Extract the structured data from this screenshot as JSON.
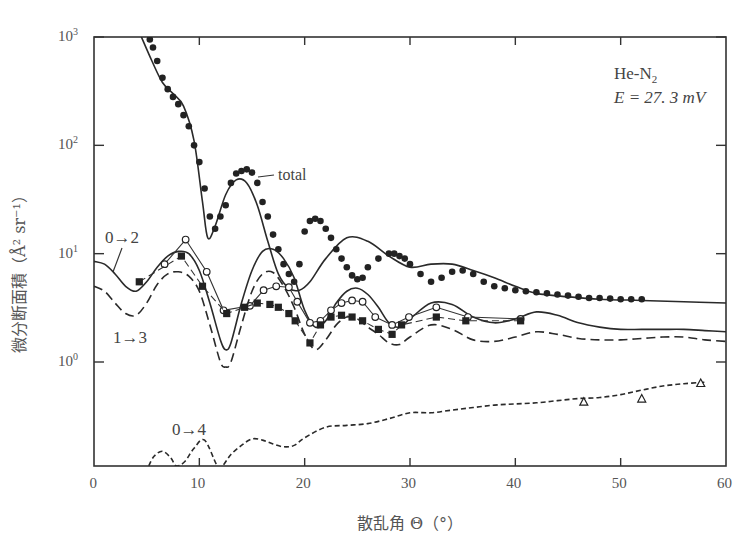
{
  "chart_data": {
    "type": "line",
    "annotation_system": "He-N",
    "annotation_system_sub": "2",
    "annotation_energy": "E = 27. 3 mV",
    "xlabel": "散乱角 Θ（°）",
    "ylabel": "微分断面積（Å² sr⁻¹）",
    "xlim": [
      0,
      60
    ],
    "ylim_log10": [
      -0.96,
      3
    ],
    "yscale": "log",
    "x_ticks": [
      0,
      10,
      20,
      30,
      40,
      50,
      60
    ],
    "y_ticks": [
      {
        "exp": 3,
        "label": "10",
        "sup": "3"
      },
      {
        "exp": 2,
        "label": "10",
        "sup": "2"
      },
      {
        "exp": 1,
        "label": "10",
        "sup": "1"
      },
      {
        "exp": 0,
        "label": "10",
        "sup": "0"
      }
    ],
    "labels": {
      "total": "total",
      "t02": "0→2",
      "t13": "1→3",
      "t04": "0→4"
    },
    "series": [
      {
        "name": "total (calc)",
        "style": "solid",
        "x": [
          4.5,
          5.5,
          6.5,
          7.5,
          8.5,
          9.5,
          10.3,
          10.8,
          11.5,
          12.5,
          13.5,
          14.5,
          15.5,
          16.5,
          17.5,
          18.5,
          19.5,
          20.5,
          22,
          24,
          26,
          28,
          30,
          32,
          34,
          36,
          38,
          40,
          42,
          45,
          48,
          52,
          56,
          60
        ],
        "y": [
          1000,
          600,
          380,
          300,
          230,
          110,
          30,
          14,
          18,
          35,
          48,
          45,
          28,
          13,
          6.5,
          4.8,
          4.6,
          5.5,
          9,
          14,
          13,
          9.5,
          7.5,
          8,
          8,
          7,
          6,
          5,
          4.3,
          4,
          3.8,
          3.7,
          3.6,
          3.5
        ]
      },
      {
        "name": "total (exp)",
        "style": "filled-dot",
        "x": [
          5.3,
          5.6,
          6,
          6.5,
          7,
          7.5,
          8,
          8.5,
          9,
          9.5,
          10,
          10.5,
          11,
          11.5,
          12,
          12.5,
          13,
          13.5,
          14,
          14.5,
          15,
          15.5,
          16,
          16.5,
          17,
          17.5,
          18,
          18.5,
          19,
          19.5,
          20,
          20.5,
          21,
          21.5,
          22,
          22.5,
          23,
          23.5,
          24,
          24.5,
          25,
          25.5,
          26,
          27,
          28,
          28.5,
          29,
          29.5,
          30,
          31,
          32,
          33,
          34,
          35,
          36,
          37,
          38,
          39,
          40,
          41,
          42,
          43,
          44,
          45,
          46,
          47,
          48,
          49,
          50,
          51,
          52
        ],
        "y": [
          950,
          800,
          600,
          420,
          330,
          280,
          240,
          190,
          150,
          100,
          70,
          40,
          22,
          17,
          22,
          28,
          45,
          55,
          58,
          60,
          56,
          45,
          30,
          22,
          15,
          11,
          8,
          6.5,
          5.5,
          8,
          16,
          20,
          21,
          20,
          17,
          14,
          11,
          9,
          7.5,
          6.3,
          5.8,
          6,
          7.5,
          9,
          10,
          10,
          9.5,
          9,
          8,
          6.5,
          5.5,
          6,
          6.8,
          7,
          6.5,
          5.5,
          5,
          4.8,
          4.6,
          4.5,
          4.4,
          4.3,
          4.2,
          4.1,
          4.0,
          3.9,
          3.9,
          3.85,
          3.8,
          3.8,
          3.8
        ]
      },
      {
        "name": "0→2 (calc)",
        "style": "solid",
        "x": [
          0,
          1,
          2,
          3,
          4,
          5,
          6,
          7,
          8,
          9,
          10,
          11,
          12,
          12.5,
          13,
          14,
          15,
          16,
          17,
          18,
          19,
          20,
          21,
          22,
          23,
          24,
          25,
          26,
          27,
          28,
          29,
          30,
          32,
          34,
          36,
          38,
          40,
          42,
          44,
          46,
          48,
          50,
          52,
          54,
          56,
          58,
          60
        ],
        "y": [
          8.5,
          8,
          6.5,
          5,
          4.5,
          5.5,
          7.5,
          9.5,
          10.5,
          10,
          7,
          3.5,
          1.6,
          1.3,
          1.5,
          3.5,
          7,
          10.5,
          11,
          9,
          6,
          3,
          2.1,
          2.4,
          3.5,
          4.5,
          4.8,
          4.2,
          3.2,
          2.3,
          2.1,
          2.5,
          3.5,
          3.4,
          2.6,
          2.3,
          2.5,
          2.9,
          2.7,
          2.3,
          2.1,
          2.0,
          2.0,
          2.0,
          2.0,
          1.95,
          1.9
        ]
      },
      {
        "name": "0→2 (exp)",
        "style": "open-circle",
        "x": [
          6.7,
          8.7,
          10.7,
          12.3,
          14.8,
          16.1,
          17.3,
          18.5,
          19.3,
          20.5,
          21.5,
          22.5,
          23.5,
          24.5,
          25.5,
          26.7,
          28.3,
          29.9,
          32.5,
          35.5,
          40.5
        ],
        "y": [
          8,
          13.5,
          6.8,
          3.0,
          3.3,
          4.6,
          5.0,
          4.9,
          3.6,
          2.3,
          2.4,
          3.0,
          3.5,
          3.7,
          3.6,
          2.6,
          2.2,
          2.6,
          3.2,
          2.6,
          2.5
        ]
      },
      {
        "name": "1→3 (calc)",
        "style": "dashed",
        "x": [
          0,
          1,
          2,
          3,
          4,
          5,
          6,
          7,
          8,
          9,
          10,
          11,
          12,
          12.5,
          13,
          14,
          15,
          16,
          17,
          18,
          19,
          20,
          21,
          22,
          23,
          24,
          25,
          26,
          27,
          28,
          29,
          30,
          32,
          34,
          36,
          38,
          40,
          42,
          44,
          46,
          48,
          50,
          52,
          54,
          56,
          58,
          60
        ],
        "y": [
          5,
          4.5,
          3.5,
          2.8,
          2.7,
          3.5,
          5.2,
          6.5,
          6.8,
          6.2,
          4.5,
          2.2,
          1.0,
          0.9,
          1.0,
          2.2,
          4.5,
          6.5,
          6.7,
          5,
          3.2,
          1.8,
          1.3,
          1.6,
          2.2,
          2.6,
          2.5,
          2.1,
          1.8,
          1.5,
          1.45,
          1.7,
          2.2,
          2.0,
          1.6,
          1.55,
          1.7,
          1.9,
          1.8,
          1.65,
          1.6,
          1.6,
          1.65,
          1.7,
          1.7,
          1.6,
          1.55
        ]
      },
      {
        "name": "1→3 (exp)",
        "style": "filled-square",
        "x": [
          4.3,
          8.3,
          10.3,
          12.6,
          14.3,
          15.5,
          16.7,
          17.5,
          18.5,
          19.1,
          20.5,
          21.5,
          22.5,
          23.5,
          24.5,
          25.5,
          27,
          28.3,
          29.2,
          32.5,
          35.3,
          40.5
        ],
        "y": [
          5.5,
          9.5,
          5.0,
          2.8,
          3.2,
          3.5,
          3.4,
          3.2,
          2.8,
          2.4,
          1.5,
          2.2,
          2.6,
          2.7,
          2.6,
          2.4,
          2.0,
          1.8,
          2.2,
          2.6,
          2.4,
          2.4
        ]
      },
      {
        "name": "0→4 (calc)",
        "style": "short-dashed",
        "x": [
          5.2,
          5.7,
          6.5,
          7.3,
          7.8,
          8.6,
          9.5,
          10.5,
          11.7,
          12.2,
          13,
          14,
          15,
          16,
          17,
          18,
          19,
          20,
          22,
          24,
          26,
          28,
          30,
          32,
          34,
          36,
          38,
          40,
          42,
          44,
          46,
          48,
          50,
          52,
          54,
          56,
          58
        ],
        "y": [
          0.11,
          0.135,
          0.15,
          0.13,
          0.11,
          0.12,
          0.16,
          0.19,
          0.11,
          0.11,
          0.14,
          0.17,
          0.195,
          0.19,
          0.175,
          0.165,
          0.17,
          0.2,
          0.25,
          0.26,
          0.27,
          0.3,
          0.34,
          0.34,
          0.36,
          0.38,
          0.4,
          0.41,
          0.42,
          0.44,
          0.46,
          0.47,
          0.5,
          0.55,
          0.6,
          0.63,
          0.65
        ]
      },
      {
        "name": "0→4 (exp)",
        "style": "open-triangle",
        "x": [
          46.5,
          52,
          57.6
        ],
        "y": [
          0.43,
          0.46,
          0.64
        ]
      }
    ]
  }
}
